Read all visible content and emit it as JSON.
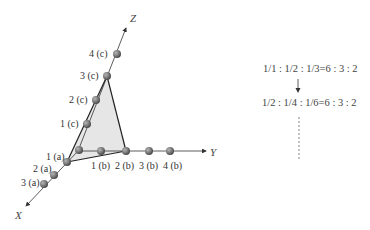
{
  "diagram": {
    "axes": {
      "x_label": "X",
      "y_label": "Y",
      "z_label": "Z"
    },
    "x_points": [
      {
        "label": "1 (a)"
      },
      {
        "label": "2 (a)"
      },
      {
        "label": "3 (a)"
      }
    ],
    "y_points": [
      {
        "label": "1 (b)"
      },
      {
        "label": "2 (b)"
      },
      {
        "label": "3 (b)"
      },
      {
        "label": "4 (b)"
      }
    ],
    "z_points": [
      {
        "label": "1 (c)"
      },
      {
        "label": "2 (c)"
      },
      {
        "label": "3 (c)"
      },
      {
        "label": "4 (c)"
      }
    ],
    "plane": {
      "vertices": [
        "1 (a)",
        "2 (b)",
        "3 (c)"
      ],
      "fill_color": "#e6e6e6",
      "edge_color": "#222222"
    },
    "ball_color": "#7a7a7a"
  },
  "ratios": {
    "line1": "1/1 : 1/2 : 1/3=6 : 3 : 2",
    "arrow": "down-arrow",
    "line2": "1/2 : 1/4 : 1/6=6 : 3 : 2",
    "continuation": "vertical-ellipsis"
  }
}
